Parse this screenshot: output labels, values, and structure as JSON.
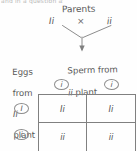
{
  "figure": {
    "type": "punnett-square",
    "top_clipped_text": "and in a question asking",
    "heading": "Parents",
    "cross_symbol": "×",
    "parent_left_genotype": "Ii",
    "parent_right_genotype": "ii",
    "sperm_caption_line1": "Sperm from",
    "sperm_caption_line2_allele": "ii",
    "sperm_caption_line2_rest": " plant",
    "eggs_caption_line1": "Eggs",
    "eggs_caption_line2": "from",
    "eggs_caption_line3_allele": "Ii",
    "eggs_caption_line4": "plant",
    "column_headers": [
      "i",
      "i"
    ],
    "row_headers": [
      "I",
      "i"
    ],
    "cells": [
      [
        "Ii",
        "Ii"
      ],
      [
        "ii",
        "ii"
      ]
    ],
    "ink_color": "#565656",
    "rule_color": "#808080",
    "paper_color": "#fefefe"
  }
}
